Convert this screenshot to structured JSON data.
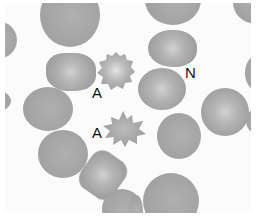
{
  "image": {
    "description": "Micrograph of red blood cells (blood smear) with annotated cells",
    "labels": [
      {
        "text": "A",
        "x": 93,
        "y": 87
      },
      {
        "text": "A",
        "x": 93,
        "y": 127
      },
      {
        "text": "N",
        "x": 186,
        "y": 66
      }
    ],
    "colors": {
      "background": "#fbfbfb",
      "cell": "#a6a6a6",
      "cell_center": "#d2d2d2",
      "label": "#111111"
    }
  }
}
